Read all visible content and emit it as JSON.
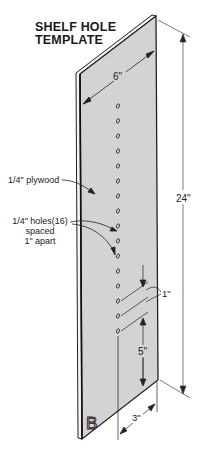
{
  "title": {
    "line1": "SHELF HOLE",
    "line2": "TEMPLATE"
  },
  "labels": {
    "material": "1/4\" plywood",
    "holes_line1": "1/4\" holes(16)",
    "holes_line2": "spaced",
    "holes_line3": "1\" apart",
    "width": "6\"",
    "height": "24\"",
    "spacing": "1\"",
    "bottom_offset": "5\"",
    "edge_offset": "3\"",
    "board_mark": "B"
  },
  "template": {
    "hole_count": 16,
    "hole_diameter": "1/4\"",
    "hole_spacing": "1\"",
    "board_width": "6\"",
    "board_height": "24\"",
    "colors": {
      "board_face": "#d3d3d3",
      "board_edge": "#2a2a2a",
      "line": "#333333"
    }
  }
}
